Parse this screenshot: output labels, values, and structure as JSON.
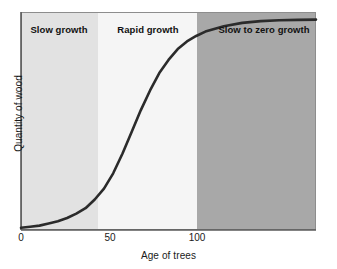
{
  "chart_data": {
    "type": "line",
    "title": "",
    "xlabel": "Age of trees",
    "ylabel": "Quantity of wood",
    "xlim": [
      0,
      160
    ],
    "ylim": [
      0,
      100
    ],
    "xticks": [
      0,
      50,
      100
    ],
    "xtick_labels": [
      "0",
      "50",
      "100"
    ],
    "yticks": [],
    "ytick_labels": [],
    "grid": false,
    "legend": "none",
    "series": [
      {
        "name": "Quantity of wood",
        "color": "#2b2b2b",
        "x": [
          0,
          5,
          10,
          15,
          20,
          25,
          30,
          35,
          40,
          45,
          50,
          55,
          60,
          65,
          70,
          75,
          80,
          85,
          90,
          95,
          100,
          110,
          120,
          130,
          140,
          150,
          160
        ],
        "y": [
          1,
          1.5,
          2,
          3,
          4,
          5.5,
          7.5,
          10,
          14,
          19,
          26,
          35,
          45,
          55,
          64,
          72,
          78,
          83,
          86.5,
          89,
          91,
          93.5,
          95,
          95.8,
          96.2,
          96.4,
          96.5
        ]
      }
    ],
    "bands": [
      {
        "id": "slow-growth",
        "label": "Slow growth",
        "x_start": 0,
        "x_end": 50,
        "color": "#e2e2e2",
        "label_x_px": 59,
        "left_px": 21,
        "width_px": 77
      },
      {
        "id": "rapid-growth",
        "label": "Rapid growth",
        "x_start": 50,
        "x_end": 100,
        "color": "#f5f5f5",
        "label_x_px": 148,
        "left_px": 98,
        "width_px": 99
      },
      {
        "id": "slow-to-zero-growth",
        "label": "Slow to zero growth",
        "x_start": 100,
        "x_end": 160,
        "color": "#a8a8a8",
        "label_x_px": 264,
        "left_px": 197,
        "width_px": 119
      }
    ],
    "axis_color": "#5a5a5a",
    "curve_color": "#2b2b2b",
    "plot_area_px": {
      "left": 21,
      "top": 12,
      "width": 295,
      "height": 218
    },
    "tick_positions_px": [
      21,
      110,
      197
    ]
  }
}
